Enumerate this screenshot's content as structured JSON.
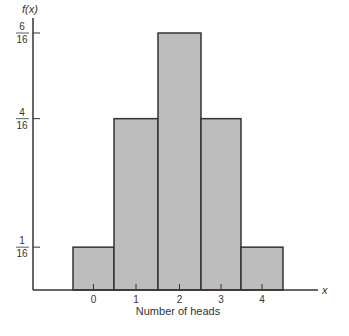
{
  "chart_data": {
    "type": "bar",
    "title": "",
    "xlabel": "Number of heads",
    "ylabel": "f(x)",
    "x_axis_symbol": "x",
    "categories": [
      "0",
      "1",
      "2",
      "3",
      "4"
    ],
    "values": [
      0.0625,
      0.25,
      0.375,
      0.25,
      0.0625
    ],
    "values_fraction": [
      "1/16",
      "4/16",
      "6/16",
      "4/16",
      "1/16"
    ],
    "yticks": [
      {
        "num": "1",
        "den": "16",
        "value": 0.0625
      },
      {
        "num": "4",
        "den": "16",
        "value": 0.25
      },
      {
        "num": "6",
        "den": "16",
        "value": 0.375
      }
    ],
    "ylim": [
      0,
      0.4
    ],
    "grid": false,
    "legend": null,
    "bar_color": "#bdbdbd",
    "edge_color": "#333333"
  }
}
